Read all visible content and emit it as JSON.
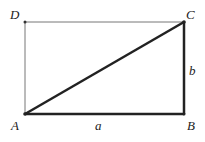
{
  "diagram": {
    "type": "rectangle-with-diagonal",
    "vertices": {
      "A": {
        "label": "A",
        "x": 25,
        "y": 114
      },
      "B": {
        "label": "B",
        "x": 184,
        "y": 114
      },
      "C": {
        "label": "C",
        "x": 184,
        "y": 22
      },
      "D": {
        "label": "D",
        "x": 25,
        "y": 22
      }
    },
    "side_labels": {
      "AB": "a",
      "BC": "b"
    },
    "colors": {
      "thin_line": "#777777",
      "thick_line": "#222222"
    }
  }
}
